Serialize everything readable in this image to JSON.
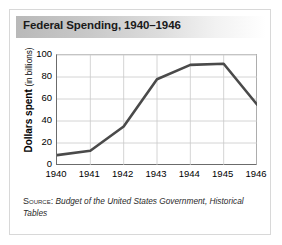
{
  "figure": {
    "title": "Federal Spending, 1940–1946",
    "source_label": "Source:",
    "source_text": "Budget of the United States Government, Historical Tables"
  },
  "axis": {
    "y_title_main": "Dollars spent",
    "y_title_sub": "(in billions)"
  },
  "chart_data": {
    "type": "line",
    "title": "Federal Spending, 1940–1946",
    "xlabel": "",
    "ylabel": "Dollars spent (in billions)",
    "categories": [
      "1940",
      "1941",
      "1942",
      "1943",
      "1944",
      "1945",
      "1946"
    ],
    "x": [
      1940,
      1941,
      1942,
      1943,
      1944,
      1945,
      1946
    ],
    "values": [
      9,
      13,
      35,
      78,
      91,
      92,
      55
    ],
    "series": [
      {
        "name": "Federal spending",
        "values": [
          9,
          13,
          35,
          78,
          91,
          92,
          55
        ]
      }
    ],
    "ylim": [
      0,
      100
    ],
    "yticks": [
      0,
      20,
      40,
      60,
      80,
      100
    ],
    "xlim": [
      1940,
      1946
    ],
    "xticks": [
      "1940",
      "1941",
      "1942",
      "1943",
      "1944",
      "1945",
      "1946"
    ],
    "grid": "horizontal-and-vertical",
    "legend": "none",
    "line_color": "#4a4a4a",
    "grid_color": "#c9c9c9"
  },
  "colors": {
    "line": "#4a4a4a",
    "grid": "#c9c9c9",
    "axis": "#6b6b6b",
    "title_bar_start": "#b9b9b9",
    "frame_border": "#d8d8d8"
  }
}
